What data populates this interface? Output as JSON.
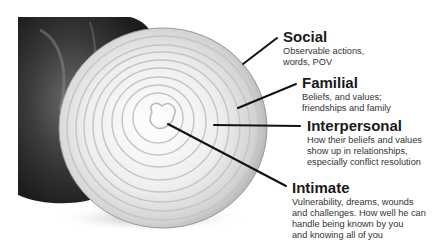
{
  "diagram": {
    "image": "sliced-onion-cross-section",
    "layers": [
      {
        "title": "Social",
        "description_lines": [
          "Observable actions,",
          "words, POV"
        ]
      },
      {
        "title": "Familial",
        "description_lines": [
          "Beliefs, and values;",
          "friendships and family"
        ]
      },
      {
        "title": "Interpersonal",
        "description_lines": [
          "How their beliefs and values",
          "show up in relationships,",
          "especially conflict resolution"
        ]
      },
      {
        "title": "Intimate",
        "description_lines": [
          "Vulnerability, dreams, wounds",
          "and challenges. How well he can",
          "handle being known by you",
          "and knowing all of you"
        ]
      }
    ],
    "colors": {
      "line": "#111111",
      "onion_flesh": "#f2f2f2",
      "onion_skin": "#3a3a3a",
      "background": "#ffffff"
    }
  }
}
